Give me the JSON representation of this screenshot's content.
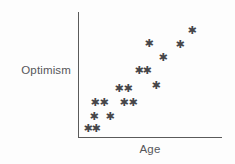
{
  "chart_data": {
    "type": "scatter",
    "title": "",
    "xlabel": "Age",
    "ylabel": "Optimism",
    "marker": "star",
    "marker_glyph": "✱",
    "grid": false,
    "legend": null,
    "axes": {
      "x_ticks": [],
      "y_ticks": [],
      "x_tick_labels": [],
      "y_tick_labels": [],
      "xlim_pixels": [
        78,
        222
      ],
      "ylim_pixels": [
        137,
        12
      ],
      "description": "Unlabeled qualitative axes; only axis lines drawn, no tick marks or numeric scale."
    },
    "relationship": "positive",
    "n_points": 19,
    "points": [
      {
        "x_px": 88,
        "y_px": 128
      },
      {
        "x_px": 96,
        "y_px": 128
      },
      {
        "x_px": 94,
        "y_px": 116
      },
      {
        "x_px": 110,
        "y_px": 116
      },
      {
        "x_px": 95,
        "y_px": 102
      },
      {
        "x_px": 104,
        "y_px": 102
      },
      {
        "x_px": 124,
        "y_px": 102
      },
      {
        "x_px": 133,
        "y_px": 102
      },
      {
        "x_px": 119,
        "y_px": 88
      },
      {
        "x_px": 128,
        "y_px": 88
      },
      {
        "x_px": 156,
        "y_px": 85
      },
      {
        "x_px": 139,
        "y_px": 70
      },
      {
        "x_px": 147,
        "y_px": 70
      },
      {
        "x_px": 163,
        "y_px": 57
      },
      {
        "x_px": 149,
        "y_px": 43
      },
      {
        "x_px": 180,
        "y_px": 44
      },
      {
        "x_px": 192,
        "y_px": 30
      }
    ]
  },
  "labels": {
    "y_axis": "Optimism",
    "x_axis": "Age"
  },
  "colors": {
    "axis": "#5a5a5a",
    "label_text": "#56565a",
    "marker": "#46464a",
    "background": "#fdfdfd"
  }
}
